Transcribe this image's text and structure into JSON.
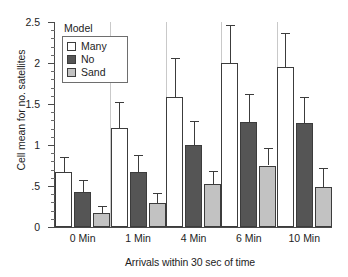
{
  "chart_data": {
    "type": "bar",
    "title": "",
    "xlabel": "Arrivals within 30 sec of time",
    "ylabel": "Cell mean for no. satellites",
    "categories": [
      "0 Min",
      "1 Min",
      "4 Min",
      "6 Min",
      "10 Min"
    ],
    "ylim": [
      0,
      2.5
    ],
    "ytick_labels": [
      "0",
      ".5",
      "1",
      "1.5",
      "2",
      "2.5"
    ],
    "ytick_values": [
      0,
      0.5,
      1,
      1.5,
      2,
      2.5
    ],
    "yminor_step": 0.1,
    "grid": false,
    "legend_title": "Model",
    "legend_position": "upper-left-inside",
    "error_bars": "upper only",
    "series": [
      {
        "name": "Many",
        "color": "#ffffff",
        "values": [
          0.67,
          1.21,
          1.58,
          2.0,
          1.95
        ],
        "errors_upper": [
          0.85,
          1.52,
          2.06,
          2.46,
          2.37
        ]
      },
      {
        "name": "No",
        "color": "#555555",
        "values": [
          0.43,
          0.67,
          1.0,
          1.28,
          1.27
        ],
        "errors_upper": [
          0.57,
          0.88,
          1.29,
          1.62,
          1.59
        ]
      },
      {
        "name": "Sand",
        "color": "#c2c2c2",
        "values": [
          0.17,
          0.29,
          0.52,
          0.75,
          0.49
        ],
        "errors_upper": [
          0.26,
          0.42,
          0.68,
          0.96,
          0.72
        ]
      }
    ]
  }
}
